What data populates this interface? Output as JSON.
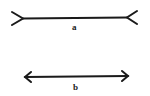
{
  "figure": {
    "lines": [
      {
        "label": "a",
        "style": "fins-outward"
      },
      {
        "label": "b",
        "style": "arrowheads"
      }
    ]
  }
}
